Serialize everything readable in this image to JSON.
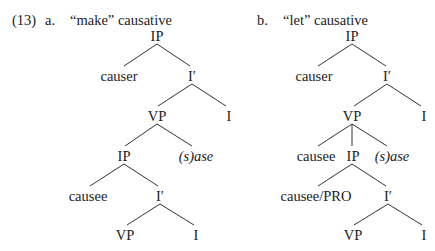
{
  "example_number": "(13)",
  "trees": [
    {
      "letter": "a.",
      "title": "“make” causative",
      "nodes": {
        "root": "IP",
        "causer": "causer",
        "ibar1": "I′",
        "vp1": "VP",
        "i1": "I",
        "ip2": "IP",
        "sase": "(s)ase",
        "causee": "causee",
        "ibar2": "I′",
        "vp2": "VP",
        "i2": "I"
      }
    },
    {
      "letter": "b.",
      "title": "“let” causative",
      "nodes": {
        "root": "IP",
        "causer": "causer",
        "ibar1": "I′",
        "vp1": "VP",
        "i1": "I",
        "causee": "causee",
        "ip2": "IP",
        "sase": "(s)ase",
        "causee_pro": "causee/PRO",
        "ibar2": "I′",
        "vp2": "VP",
        "i2": "I"
      }
    }
  ]
}
